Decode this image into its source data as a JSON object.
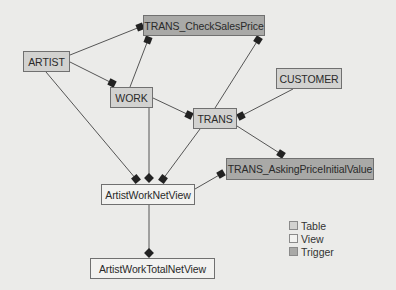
{
  "diagram": {
    "colors": {
      "background": "#ebebe9",
      "table": "#d2d2d0",
      "view": "#f2f2f0",
      "trigger": "#a9a9a7",
      "edge": "#555555",
      "marker": "#222222"
    },
    "nodes": [
      {
        "id": "trans_checksalesprice",
        "label": "TRANS_CheckSalesPrice",
        "type": "trigger",
        "x": 143,
        "y": 15,
        "w": 122,
        "h": 21
      },
      {
        "id": "artist",
        "label": "ARTIST",
        "type": "table",
        "x": 23,
        "y": 51,
        "w": 47,
        "h": 21
      },
      {
        "id": "customer",
        "label": "CUSTOMER",
        "type": "table",
        "x": 276,
        "y": 68,
        "w": 66,
        "h": 21
      },
      {
        "id": "work",
        "label": "WORK",
        "type": "table",
        "x": 110,
        "y": 87,
        "w": 43,
        "h": 21
      },
      {
        "id": "trans",
        "label": "TRANS",
        "type": "table",
        "x": 193,
        "y": 108,
        "w": 44,
        "h": 21
      },
      {
        "id": "trans_askingpriceinitialvalue",
        "label": "TRANS_AskingPriceInitialValue",
        "type": "trigger",
        "x": 226,
        "y": 158,
        "w": 148,
        "h": 22
      },
      {
        "id": "artistworknetview",
        "label": "ArtistWorkNetView",
        "type": "view",
        "x": 101,
        "y": 184,
        "w": 94,
        "h": 21
      },
      {
        "id": "artistworktotalnetview",
        "label": "ArtistWorkTotalNetView",
        "type": "view",
        "x": 90,
        "y": 258,
        "w": 125,
        "h": 21
      }
    ],
    "edges": [
      {
        "from": "artist",
        "to": "trans_checksalesprice",
        "x1": 70,
        "y1": 55,
        "x2": 140,
        "y2": 27,
        "marker": "square"
      },
      {
        "from": "work",
        "to": "trans_checksalesprice",
        "x1": 130,
        "y1": 87,
        "x2": 148,
        "y2": 40,
        "marker": "square"
      },
      {
        "from": "trans",
        "to": "trans_checksalesprice",
        "x1": 215,
        "y1": 108,
        "x2": 258,
        "y2": 40,
        "marker": "square"
      },
      {
        "from": "artist",
        "to": "work",
        "x1": 70,
        "y1": 62,
        "x2": 112,
        "y2": 83,
        "marker": "square"
      },
      {
        "from": "work",
        "to": "trans",
        "x1": 153,
        "y1": 98,
        "x2": 189,
        "y2": 115,
        "marker": "square"
      },
      {
        "from": "customer",
        "to": "trans",
        "x1": 293,
        "y1": 89,
        "x2": 241,
        "y2": 116,
        "marker": "square"
      },
      {
        "from": "trans",
        "to": "trans_askingpriceinitialvalue",
        "x1": 237,
        "y1": 126,
        "x2": 281,
        "y2": 154,
        "marker": "square"
      },
      {
        "from": "artist",
        "to": "artistworknetview",
        "x1": 46,
        "y1": 72,
        "x2": 136,
        "y2": 179,
        "marker": "square"
      },
      {
        "from": "work",
        "to": "artistworknetview",
        "x1": 149,
        "y1": 108,
        "x2": 149,
        "y2": 178,
        "marker": "diamond"
      },
      {
        "from": "trans",
        "to": "artistworknetview",
        "x1": 200,
        "y1": 129,
        "x2": 163,
        "y2": 179,
        "marker": "square"
      },
      {
        "from": "artistworknetview",
        "to": "trans_askingpriceinitialvalue",
        "x1": 195,
        "y1": 189,
        "x2": 221,
        "y2": 174,
        "marker": "square"
      },
      {
        "from": "artistworknetview",
        "to": "artistworktotalnetview",
        "x1": 149,
        "y1": 205,
        "x2": 149,
        "y2": 253,
        "marker": "diamond"
      }
    ]
  },
  "legend": {
    "items": [
      {
        "label": "Table",
        "color": "#d2d2d0"
      },
      {
        "label": "View",
        "color": "#f2f2f0"
      },
      {
        "label": "Trigger",
        "color": "#a9a9a7"
      }
    ]
  }
}
